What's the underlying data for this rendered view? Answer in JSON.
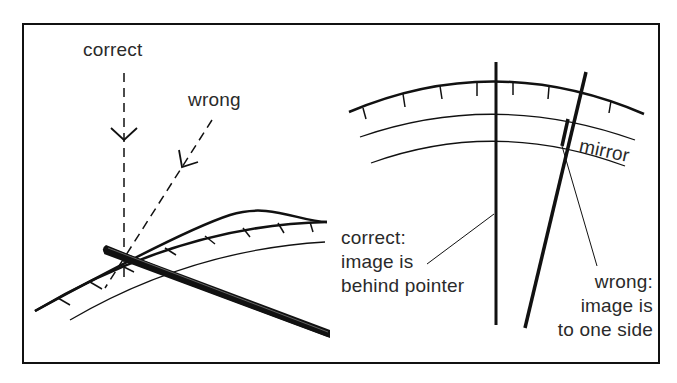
{
  "figure": {
    "left_panel": {
      "correct_label": "correct",
      "wrong_label": "wrong"
    },
    "right_panel": {
      "mirror_label": "mirror",
      "correct_caption": [
        "correct:",
        "image is",
        "behind pointer"
      ],
      "wrong_caption": [
        "wrong:",
        "image is",
        "to one side"
      ]
    },
    "colors": {
      "ink": "#111111",
      "background": "#ffffff"
    }
  }
}
